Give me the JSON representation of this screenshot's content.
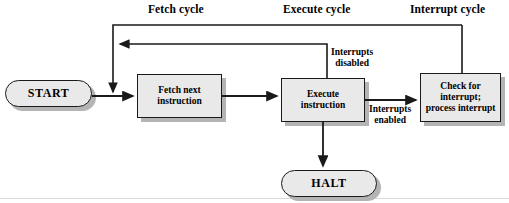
{
  "diagram": {
    "cycle_labels": [
      {
        "text": "Fetch cycle",
        "x": 148,
        "y": 4
      },
      {
        "text": "Execute cycle",
        "x": 285,
        "y": 4
      },
      {
        "text": "Interrupt cycle",
        "x": 412,
        "y": 4
      }
    ],
    "nodes": [
      {
        "id": "start",
        "shape": "oval",
        "label": "START"
      },
      {
        "id": "fetch",
        "shape": "rect",
        "label_line1": "Fetch next",
        "label_line2": "instruction"
      },
      {
        "id": "execute",
        "shape": "rect",
        "label_line1": "Execute",
        "label_line2": "instruction"
      },
      {
        "id": "check",
        "shape": "rect",
        "label_line1": "Check for",
        "label_line2": "interrupt;",
        "label_line3": "process interrupt"
      },
      {
        "id": "halt",
        "shape": "oval",
        "label": "HALT"
      }
    ],
    "edge_labels": [
      {
        "id": "interrupts-disabled",
        "line1": "Interrupts",
        "line2": "disabled",
        "x": 331,
        "y": 49
      },
      {
        "id": "interrupts-enabled",
        "line1": "Interrupts",
        "line2": "enabled",
        "x": 371,
        "y": 104
      }
    ],
    "colors": {
      "node_fill": "#e9e9e9",
      "node_stroke": "#1a1a1a",
      "shadow": "#b4b4b4",
      "line": "#1a1a1a",
      "background": "#ffffff",
      "baseline": "#d9d9d9"
    }
  }
}
